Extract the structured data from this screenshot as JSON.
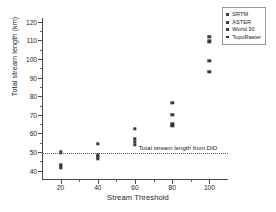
{
  "chart_data": {
    "type": "scatter",
    "title": "",
    "xlabel": "Stream Threshold",
    "ylabel": "Total stream length (km)",
    "xlim": [
      10,
      110
    ],
    "ylim": [
      35,
      122
    ],
    "grid": false,
    "x_ticks": [
      20,
      40,
      60,
      80,
      100
    ],
    "x_minor_ticks": [
      30,
      50,
      70,
      90
    ],
    "y_ticks": [
      40,
      50,
      60,
      70,
      80,
      90,
      100,
      110,
      120
    ],
    "y_minor_ticks": [
      45,
      55,
      65,
      75,
      85,
      95,
      105,
      115
    ],
    "legend_position": "top-right",
    "categories": [
      20,
      40,
      60,
      80,
      100
    ],
    "series": [
      {
        "name": "SRTM",
        "color": "#3a3a3a",
        "values": [
          49.8,
          54.5,
          62.5,
          76.5,
          112.0
        ]
      },
      {
        "name": "ASTER",
        "color": "#3a3a3a",
        "values": [
          43.0,
          48.2,
          57.0,
          70.0,
          109.5
        ]
      },
      {
        "name": "World 30",
        "color": "#3a3a3a",
        "values": [
          42.3,
          47.5,
          55.5,
          65.0,
          99.0
        ]
      },
      {
        "name": "TopoRaster",
        "color": "#3a3a3a",
        "values": [
          41.5,
          46.5,
          54.0,
          64.0,
          93.0
        ]
      }
    ],
    "annotations": [
      {
        "name": "reference-line",
        "text": "Total stream length from DiD",
        "y_value": 49.5,
        "style": "dotted"
      }
    ]
  }
}
